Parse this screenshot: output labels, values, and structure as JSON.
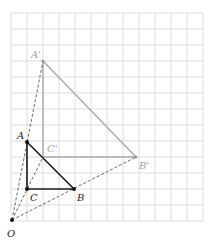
{
  "diagram": {
    "type": "homothety-triangle-construction",
    "grid": {
      "x0": 11,
      "y0": 13,
      "cols": 12,
      "rows": 13,
      "cell": 16,
      "color": "#d4d4d4"
    },
    "colors": {
      "original": "#1a1a1a",
      "image": "#9a9a9a",
      "dashed": "#555555",
      "label_image": "#a0a0a0"
    },
    "points": {
      "O": {
        "label": "O",
        "x": 12,
        "y": 220
      },
      "A": {
        "label": "A",
        "x": 27,
        "y": 142
      },
      "B": {
        "label": "B",
        "x": 74,
        "y": 189
      },
      "C": {
        "label": "C",
        "x": 27,
        "y": 189
      },
      "A_prime": {
        "label": "A'",
        "x": 43,
        "y": 61
      },
      "B_prime": {
        "label": "B'",
        "x": 136,
        "y": 157
      },
      "C_prime": {
        "label": "C'",
        "x": 43,
        "y": 157
      }
    }
  }
}
